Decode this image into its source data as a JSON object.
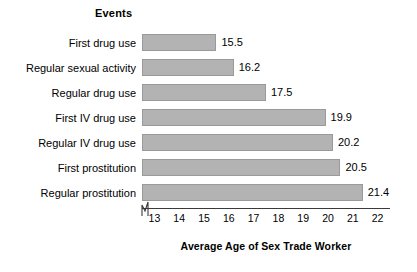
{
  "chart_data": {
    "type": "bar",
    "orientation": "horizontal",
    "title": "",
    "categories_header": "Events",
    "categories": [
      "First drug use",
      "Regular sexual activity",
      "Regular drug use",
      "First IV drug use",
      "Regular IV drug use",
      "First prostitution",
      "Regular prostitution"
    ],
    "values": [
      15.5,
      16.2,
      17.5,
      19.9,
      20.2,
      20.5,
      21.4
    ],
    "value_labels": [
      "15.5",
      "16.2",
      "17.5",
      "19.9",
      "20.2",
      "20.5",
      "21.4"
    ],
    "xlabel": "Average Age of Sex Trade Worker",
    "ylabel": "Events",
    "xlim": [
      12.5,
      22.5
    ],
    "x_axis_broken": true,
    "x_tick_labels": [
      "13",
      "14",
      "15",
      "16",
      "17",
      "18",
      "19",
      "20",
      "21",
      "22"
    ],
    "x_ticks": [
      13,
      14,
      15,
      16,
      17,
      18,
      19,
      20,
      21,
      22
    ],
    "grid": false,
    "legend": "none",
    "bar_color": "#b3b3b3",
    "bar_edge_color": "#9a9a9a",
    "axis_color": "#3a3a3a",
    "text_color": "#000000",
    "background": "#ffffff"
  }
}
